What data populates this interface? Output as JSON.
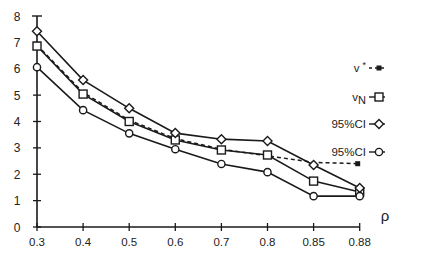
{
  "chart_data": {
    "type": "line",
    "title": "",
    "xlabel": "ρ",
    "ylabel": "",
    "categories": [
      "0.3",
      "0.4",
      "0.5",
      "0.6",
      "0.7",
      "0.8",
      "0.85",
      "0.88"
    ],
    "y_ticks": [
      0,
      1,
      2,
      3,
      4,
      5,
      6,
      7,
      8
    ],
    "ylim": [
      0,
      8
    ],
    "grid": false,
    "legend_position": "right",
    "series": [
      {
        "name": "v*",
        "label_main": "v",
        "label_sup": "*",
        "marker": "filled-square",
        "line": "dashed",
        "marker_only_at_end": true,
        "values": [
          6.9,
          5.1,
          4.05,
          3.35,
          2.95,
          2.7,
          2.45,
          2.4
        ]
      },
      {
        "name": "vN",
        "label_main": "v",
        "label_sub": "N",
        "marker": "open-square",
        "line": "solid",
        "values": [
          6.86,
          5.04,
          4.0,
          3.3,
          2.92,
          2.73,
          1.74,
          1.33
        ]
      },
      {
        "name": "95%CI",
        "label_main": "95%CI",
        "marker": "open-diamond",
        "line": "solid",
        "values": [
          7.42,
          5.57,
          4.5,
          3.56,
          3.33,
          3.26,
          2.35,
          1.48
        ]
      },
      {
        "name": "95%CI",
        "label_main": "95%CI",
        "marker": "open-circle",
        "line": "solid",
        "values": [
          6.06,
          4.43,
          3.55,
          2.95,
          2.39,
          2.08,
          1.17,
          1.17
        ]
      }
    ]
  },
  "colors": {
    "ink": "#1a1a1a",
    "background": "#ffffff"
  }
}
